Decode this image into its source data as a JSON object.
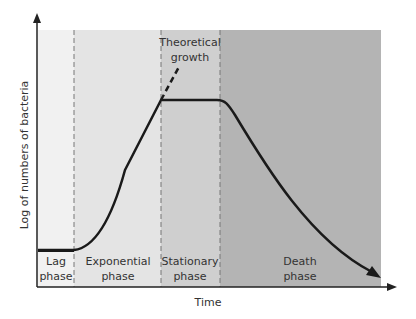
{
  "figure": {
    "y_axis_label": "Log of numbers of bacteria",
    "x_axis_label": "Time",
    "annotation": {
      "line1": "Theoretical",
      "line2": "growth"
    },
    "phases": [
      {
        "id": "lag",
        "line1": "Lag",
        "line2": "phase",
        "color": "#f1f1f1"
      },
      {
        "id": "exponential",
        "line1": "Exponential",
        "line2": "phase",
        "color": "#e4e4e4"
      },
      {
        "id": "stationary",
        "line1": "Stationary",
        "line2": "phase",
        "color": "#cfcfcf"
      },
      {
        "id": "death",
        "line1": "Death",
        "line2": "phase",
        "color": "#b4b4b4"
      }
    ],
    "colors": {
      "curve": "#1a1a1a",
      "axis": "#222222",
      "divider": "#777777",
      "text": "#333333"
    }
  }
}
